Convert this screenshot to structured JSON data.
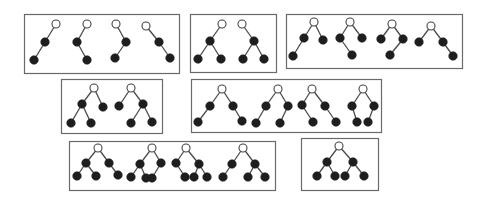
{
  "diagram": {
    "title": "Binary tree shapes grouped by structure",
    "colors": {
      "box_stroke": "#6a6a6a",
      "edge": "#4a4a4a",
      "root_fill": "#ffffff",
      "root_stroke": "#444444",
      "node_fill": "#1e1e1e"
    },
    "node_radius": 4,
    "groups": [
      {
        "id": "group-1",
        "box": [
          24,
          14,
          155,
          59
        ],
        "trees": [
          {
            "nodes": [
              [
                56,
                24,
                "root"
              ],
              [
                45,
                42,
                "n"
              ],
              [
                34,
                60,
                "n"
              ]
            ],
            "edges": [
              [
                0,
                1
              ],
              [
                1,
                2
              ]
            ]
          },
          {
            "nodes": [
              [
                87,
                24,
                "root"
              ],
              [
                77,
                42,
                "n"
              ],
              [
                87,
                60,
                "n"
              ]
            ],
            "edges": [
              [
                0,
                1
              ],
              [
                1,
                2
              ]
            ]
          },
          {
            "nodes": [
              [
                116,
                24,
                "root"
              ],
              [
                126,
                42,
                "n"
              ],
              [
                115,
                58,
                "n"
              ]
            ],
            "edges": [
              [
                0,
                1
              ],
              [
                1,
                2
              ]
            ]
          },
          {
            "nodes": [
              [
                146,
                26,
                "root"
              ],
              [
                159,
                42,
                "n"
              ],
              [
                170,
                58,
                "n"
              ]
            ],
            "edges": [
              [
                0,
                1
              ],
              [
                1,
                2
              ]
            ]
          }
        ]
      },
      {
        "id": "group-2",
        "box": [
          190,
          14,
          86,
          58
        ],
        "trees": [
          {
            "nodes": [
              [
                222,
                24,
                "root"
              ],
              [
                210,
                41,
                "n"
              ],
              [
                198,
                59,
                "n"
              ],
              [
                221,
                59,
                "n"
              ]
            ],
            "edges": [
              [
                0,
                1
              ],
              [
                1,
                2
              ],
              [
                1,
                3
              ]
            ]
          },
          {
            "nodes": [
              [
                242,
                24,
                "root"
              ],
              [
                254,
                41,
                "n"
              ],
              [
                243,
                59,
                "n"
              ],
              [
                264,
                59,
                "n"
              ]
            ],
            "edges": [
              [
                0,
                1
              ],
              [
                1,
                2
              ],
              [
                1,
                3
              ]
            ]
          }
        ]
      },
      {
        "id": "group-3",
        "box": [
          286,
          14,
          176,
          54
        ],
        "trees": [
          {
            "nodes": [
              [
                314,
                22,
                "root"
              ],
              [
                304,
                38,
                "n"
              ],
              [
                323,
                40,
                "n"
              ],
              [
                293,
                56,
                "n"
              ]
            ],
            "edges": [
              [
                0,
                1
              ],
              [
                0,
                2
              ],
              [
                1,
                3
              ]
            ]
          },
          {
            "nodes": [
              [
                350,
                22,
                "root"
              ],
              [
                340,
                38,
                "n"
              ],
              [
                362,
                38,
                "n"
              ],
              [
                352,
                55,
                "n"
              ]
            ],
            "edges": [
              [
                0,
                1
              ],
              [
                0,
                2
              ],
              [
                1,
                3
              ]
            ]
          },
          {
            "nodes": [
              [
                392,
                24,
                "root"
              ],
              [
                381,
                39,
                "n"
              ],
              [
                403,
                39,
                "n"
              ],
              [
                390,
                55,
                "n"
              ]
            ],
            "edges": [
              [
                0,
                1
              ],
              [
                0,
                2
              ],
              [
                2,
                3
              ]
            ]
          },
          {
            "nodes": [
              [
                431,
                26,
                "root"
              ],
              [
                419,
                42,
                "n"
              ],
              [
                443,
                42,
                "n"
              ],
              [
                453,
                56,
                "n"
              ]
            ],
            "edges": [
              [
                0,
                1
              ],
              [
                0,
                2
              ],
              [
                2,
                3
              ]
            ]
          }
        ]
      },
      {
        "id": "group-4",
        "box": [
          61,
          79,
          101,
          54
        ],
        "trees": [
          {
            "nodes": [
              [
                94,
                88,
                "root"
              ],
              [
                82,
                104,
                "n"
              ],
              [
                103,
                107,
                "n"
              ],
              [
                71,
                123,
                "n"
              ],
              [
                91,
                123,
                "n"
              ]
            ],
            "edges": [
              [
                0,
                1
              ],
              [
                0,
                2
              ],
              [
                1,
                3
              ],
              [
                1,
                4
              ]
            ]
          },
          {
            "nodes": [
              [
                131,
                88,
                "root"
              ],
              [
                119,
                106,
                "n"
              ],
              [
                143,
                104,
                "n"
              ],
              [
                131,
                123,
                "n"
              ],
              [
                152,
                122,
                "n"
              ]
            ],
            "edges": [
              [
                0,
                1
              ],
              [
                0,
                2
              ],
              [
                2,
                3
              ],
              [
                2,
                4
              ]
            ]
          }
        ]
      },
      {
        "id": "group-5",
        "box": [
          191,
          79,
          190,
          53
        ],
        "trees": [
          {
            "nodes": [
              [
                222,
                89,
                "root"
              ],
              [
                210,
                106,
                "n"
              ],
              [
                233,
                106,
                "n"
              ],
              [
                198,
                122,
                "n"
              ],
              [
                242,
                121,
                "n"
              ]
            ],
            "edges": [
              [
                0,
                1
              ],
              [
                0,
                2
              ],
              [
                1,
                3
              ],
              [
                2,
                4
              ]
            ]
          },
          {
            "nodes": [
              [
                278,
                89,
                "root"
              ],
              [
                266,
                106,
                "n"
              ],
              [
                288,
                106,
                "n"
              ],
              [
                256,
                123,
                "n"
              ],
              [
                280,
                123,
                "n"
              ]
            ],
            "edges": [
              [
                0,
                1
              ],
              [
                0,
                2
              ],
              [
                1,
                3
              ],
              [
                2,
                4
              ]
            ]
          },
          {
            "nodes": [
              [
                312,
                89,
                "root"
              ],
              [
                302,
                105,
                "n"
              ],
              [
                325,
                106,
                "n"
              ],
              [
                313,
                122,
                "n"
              ],
              [
                336,
                122,
                "n"
              ]
            ],
            "edges": [
              [
                0,
                1
              ],
              [
                0,
                2
              ],
              [
                1,
                3
              ],
              [
                2,
                4
              ]
            ]
          },
          {
            "nodes": [
              [
                363,
                89,
                "root"
              ],
              [
                352,
                106,
                "n"
              ],
              [
                374,
                106,
                "n"
              ],
              [
                357,
                122,
                "n"
              ],
              [
                368,
                122,
                "n"
              ]
            ],
            "edges": [
              [
                0,
                1
              ],
              [
                0,
                2
              ],
              [
                1,
                3
              ],
              [
                2,
                4
              ]
            ]
          }
        ]
      },
      {
        "id": "group-6",
        "box": [
          69,
          141,
          206,
          49
        ],
        "trees": [
          {
            "nodes": [
              [
                98,
                148,
                "root"
              ],
              [
                86,
                163,
                "n"
              ],
              [
                109,
                163,
                "n"
              ],
              [
                77,
                176,
                "n"
              ],
              [
                96,
                176,
                "n"
              ],
              [
                118,
                175,
                "n"
              ]
            ],
            "edges": [
              [
                0,
                1
              ],
              [
                0,
                2
              ],
              [
                1,
                3
              ],
              [
                1,
                4
              ],
              [
                2,
                5
              ]
            ]
          },
          {
            "nodes": [
              [
                152,
                148,
                "root"
              ],
              [
                140,
                164,
                "n"
              ],
              [
                161,
                163,
                "n"
              ],
              [
                131,
                177,
                "n"
              ],
              [
                146,
                178,
                "n"
              ],
              [
                152,
                178,
                "n"
              ]
            ],
            "edges": [
              [
                0,
                1
              ],
              [
                0,
                2
              ],
              [
                1,
                3
              ],
              [
                1,
                4
              ],
              [
                2,
                5
              ]
            ]
          },
          {
            "nodes": [
              [
                186,
                148,
                "root"
              ],
              [
                176,
                163,
                "n"
              ],
              [
                199,
                164,
                "n"
              ],
              [
                185,
                177,
                "n"
              ],
              [
                194,
                177,
                "n"
              ],
              [
                207,
                177,
                "n"
              ]
            ],
            "edges": [
              [
                0,
                1
              ],
              [
                0,
                2
              ],
              [
                1,
                3
              ],
              [
                2,
                4
              ],
              [
                2,
                5
              ]
            ]
          },
          {
            "nodes": [
              [
                243,
                148,
                "root"
              ],
              [
                232,
                164,
                "n"
              ],
              [
                255,
                164,
                "n"
              ],
              [
                223,
                177,
                "n"
              ],
              [
                248,
                177,
                "n"
              ],
              [
                265,
                177,
                "n"
              ]
            ],
            "edges": [
              [
                0,
                1
              ],
              [
                0,
                2
              ],
              [
                1,
                3
              ],
              [
                2,
                4
              ],
              [
                2,
                5
              ]
            ]
          }
        ]
      },
      {
        "id": "group-7",
        "box": [
          301,
          138,
          77,
          52
        ],
        "trees": [
          {
            "nodes": [
              [
                339,
                146,
                "root"
              ],
              [
                327,
                162,
                "n"
              ],
              [
                353,
                162,
                "n"
              ],
              [
                317,
                176,
                "n"
              ],
              [
                335,
                176,
                "n"
              ],
              [
                345,
                176,
                "n"
              ],
              [
                364,
                176,
                "n"
              ]
            ],
            "edges": [
              [
                0,
                1
              ],
              [
                0,
                2
              ],
              [
                1,
                3
              ],
              [
                1,
                4
              ],
              [
                2,
                5
              ],
              [
                2,
                6
              ]
            ]
          }
        ]
      }
    ]
  }
}
